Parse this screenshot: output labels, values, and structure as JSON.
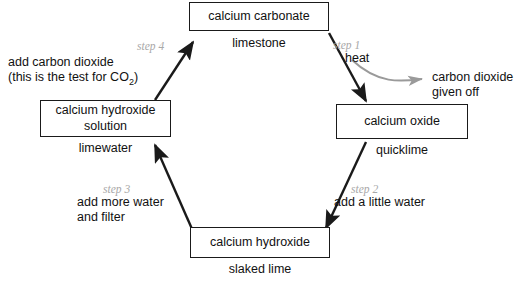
{
  "diagram": {
    "colors": {
      "stroke": "#1a1a1a",
      "step_text": "#a8a8a8",
      "gray_arrow": "#9a9a9a",
      "text": "#111111",
      "background": "#ffffff"
    },
    "nodes": [
      {
        "id": "calcium-carbonate",
        "name": "calcium carbonate",
        "common_name": "limestone"
      },
      {
        "id": "calcium-oxide",
        "name": "calcium oxide",
        "common_name": "quicklime"
      },
      {
        "id": "calcium-hydroxide",
        "name": "calcium hydroxide",
        "common_name": "slaked lime"
      },
      {
        "id": "calcium-hydroxide-solution",
        "name_line1": "calcium hydroxide",
        "name_line2": "solution",
        "common_name": "limewater"
      }
    ],
    "steps": [
      {
        "id": "step-1",
        "step_label": "step 1",
        "action_line1": "heat",
        "action_line2": "",
        "from": "calcium-carbonate",
        "to": "calcium-oxide"
      },
      {
        "id": "step-2",
        "step_label": "step 2",
        "action_line1": "add a little water",
        "action_line2": "",
        "from": "calcium-oxide",
        "to": "calcium-hydroxide"
      },
      {
        "id": "step-3",
        "step_label": "step 3",
        "action_line1": "add more water",
        "action_line2": "and filter",
        "from": "calcium-hydroxide",
        "to": "calcium-hydroxide-solution"
      },
      {
        "id": "step-4",
        "step_label": "step 4",
        "action_line1": "add carbon dioxide",
        "action_line2_pre": "(this is the test for CO",
        "action_line2_sub": "2",
        "action_line2_post": ")",
        "from": "calcium-hydroxide-solution",
        "to": "calcium-carbonate"
      }
    ],
    "byproduct": {
      "id": "carbon-dioxide-given-off",
      "line1": "carbon dioxide",
      "line2": "given off"
    }
  }
}
